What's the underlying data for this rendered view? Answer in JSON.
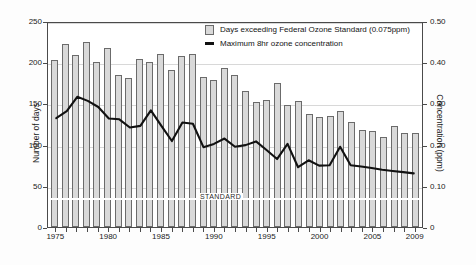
{
  "chart_data": {
    "type": "bar",
    "title": "",
    "xlabel": "",
    "ylabel": "Number of days",
    "y2label": "Concentration (ppm)",
    "ylim": [
      0,
      250
    ],
    "y2lim": [
      0,
      0.5
    ],
    "grid": true,
    "legend_position": "top-center",
    "categories": [
      "1975",
      "1976",
      "1977",
      "1978",
      "1979",
      "1980",
      "1981",
      "1982",
      "1983",
      "1984",
      "1985",
      "1986",
      "1987",
      "1988",
      "1989",
      "1990",
      "1991",
      "1992",
      "1993",
      "1994",
      "1995",
      "1996",
      "1997",
      "1998",
      "1999",
      "2000",
      "2001",
      "2002",
      "2003",
      "2004",
      "2005",
      "2006",
      "2007",
      "2008",
      "2009"
    ],
    "x_tick_labels": [
      "1975",
      "1980",
      "1985",
      "1990",
      "1995",
      "2000",
      "2005",
      "2009"
    ],
    "y_tick_labels": [
      "0",
      "50",
      "100",
      "150",
      "200",
      "250"
    ],
    "y2_tick_labels": [
      "0",
      "0.10",
      "0.20",
      "0.30",
      "0.40",
      "0.50"
    ],
    "series": [
      {
        "name": "Days exceeding Federal Ozone Standard (0.075ppm)",
        "type": "bar",
        "axis": "left",
        "unit": "days",
        "color": "#d9d9d9",
        "edge_color": "#6b6b6b",
        "values": [
          203,
          222,
          209,
          224,
          200,
          217,
          185,
          181,
          204,
          200,
          210,
          191,
          208,
          210,
          182,
          178,
          193,
          185,
          165,
          152,
          154,
          175,
          148,
          153,
          137,
          133,
          135,
          141,
          128,
          118,
          117,
          109,
          122,
          114,
          114
        ]
      },
      {
        "name": "Maximum 8hr ozone concentration",
        "type": "line",
        "axis": "right",
        "unit": "ppm",
        "color": "#111111",
        "values": [
          0.268,
          0.285,
          0.32,
          0.31,
          0.295,
          0.267,
          0.265,
          0.245,
          0.249,
          0.287,
          0.249,
          0.212,
          0.257,
          0.254,
          0.197,
          0.205,
          0.218,
          0.198,
          0.202,
          0.211,
          0.19,
          0.168,
          0.205,
          0.148,
          0.165,
          0.152,
          0.153,
          0.198,
          0.153,
          0.15,
          0.146,
          0.142,
          0.139,
          0.136,
          0.133
        ]
      }
    ],
    "annotations": [
      {
        "text": "STANDARD",
        "y_value": 0.075,
        "axis": "right"
      }
    ]
  }
}
